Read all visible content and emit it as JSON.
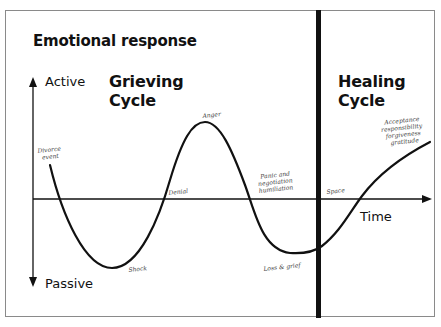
{
  "diagram": {
    "title": "Emotional response",
    "y_axis": {
      "top_label": "Active",
      "bottom_label": "Passive"
    },
    "x_axis": {
      "label": "Time"
    },
    "sections": [
      {
        "id": "grieving",
        "title_line1": "Grieving",
        "title_line2": "Cycle"
      },
      {
        "id": "healing",
        "title_line1": "Healing",
        "title_line2": "Cycle"
      }
    ],
    "annotations": {
      "divorce_line1": "Divorce",
      "divorce_line2": "event",
      "shock": "Shock",
      "denial": "Denial",
      "anger": "Anger",
      "panic_line1": "Panic and",
      "panic_line2": "negotiation",
      "panic_line3": "humiliation",
      "loss": "Loss & grief",
      "space": "Space",
      "accept_line1": "Acceptance",
      "accept_line2": "responsibility",
      "accept_line3": "forgiveness",
      "accept_line4": "gratitude"
    },
    "colors": {
      "line": "#111111",
      "frame": "#8a8a8a",
      "background": "#ffffff"
    }
  }
}
